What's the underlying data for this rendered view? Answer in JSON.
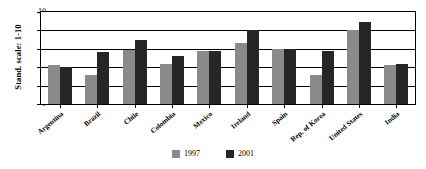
{
  "chart_data": {
    "type": "bar",
    "title": "",
    "subtitle": "",
    "xlabel": "",
    "ylabel": "Stand. scale: 1-10",
    "ylim": [
      0,
      10
    ],
    "yticks": [
      0,
      2,
      4,
      6,
      8,
      10
    ],
    "grid": true,
    "legend_position": "bottom",
    "categories": [
      "Argentina",
      "Brazil",
      "Chile",
      "Colombia",
      "Mexico",
      "Ireland",
      "Spain",
      "Rep. of Korea",
      "United States",
      "India"
    ],
    "series": [
      {
        "name": "1997",
        "color": "#8a8a8a",
        "values": [
          4.2,
          3.1,
          5.9,
          4.4,
          5.8,
          6.6,
          6.0,
          3.2,
          8.0,
          4.2
        ]
      },
      {
        "name": "2001",
        "color": "#262626",
        "values": [
          4.0,
          5.7,
          7.0,
          5.2,
          5.8,
          8.0,
          6.0,
          5.8,
          8.9,
          4.4
        ]
      }
    ]
  },
  "legend": {
    "items": [
      {
        "label": "1997",
        "color": "#8a8a8a"
      },
      {
        "label": "2001",
        "color": "#262626"
      }
    ]
  },
  "axes": {
    "y_title": "Stand. scale: 1-10",
    "y_tick_labels": [
      "0",
      "2",
      "4",
      "6",
      "8",
      "10"
    ]
  }
}
